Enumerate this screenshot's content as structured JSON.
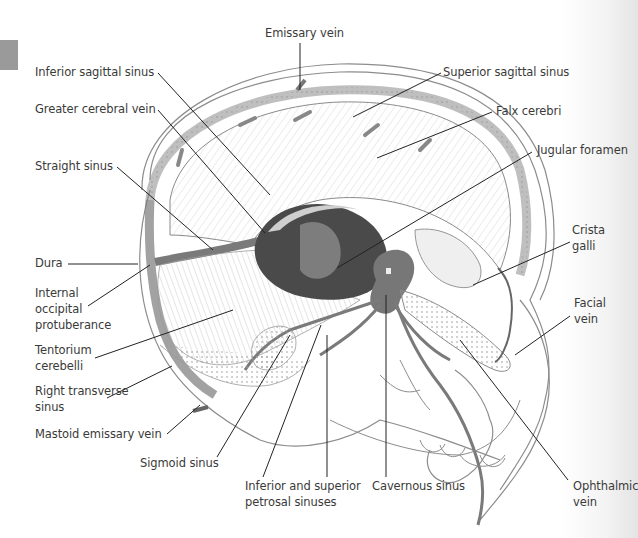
{
  "figure": {
    "labels": {
      "emissary_vein": "Emissary vein",
      "inferior_sagittal_sinus": "Inferior sagittal sinus",
      "superior_sagittal_sinus": "Superior sagittal sinus",
      "greater_cerebral_vein": "Greater cerebral vein",
      "falx_cerebri": "Falx cerebri",
      "straight_sinus": "Straight sinus",
      "jugular_foramen": "Jugular foramen",
      "crista_galli": "Crista\ngalli",
      "dura": "Dura",
      "internal_occipital_protuberance": "Internal\noccipital\nprotuberance",
      "facial_vein": "Facial\nvein",
      "tentorium_cerebelli": "Tentorium\ncerebelli",
      "right_transverse_sinus": "Right transverse\nsinus",
      "mastoid_emissary_vein": "Mastoid emissary vein",
      "sigmoid_sinus": "Sigmoid sinus",
      "inferior_superior_petrosal_sinuses": "Inferior and superior\npetrosal sinuses",
      "cavernous_sinus": "Cavernous sinus",
      "ophthalmic_vein": "Ophthalmic\nvein"
    },
    "colors": {
      "ink": "#3a3a3a",
      "sinus_fill": "#7a7a7a",
      "dark_cavity": "#4a4a4a",
      "leader": "#222222",
      "corner_tab": "#9a9a9a"
    }
  }
}
